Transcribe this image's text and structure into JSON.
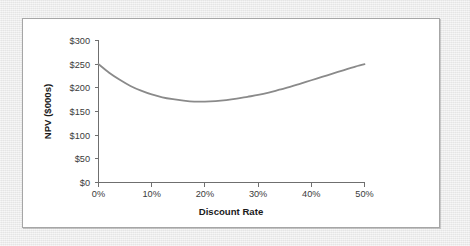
{
  "chart_data": {
    "type": "line",
    "title": "",
    "xlabel": "Discount Rate",
    "ylabel": "NPV ($000s)",
    "xlim": [
      0,
      50
    ],
    "ylim": [
      0,
      300
    ],
    "grid": false,
    "legend": false,
    "x_tick_labels": [
      "0%",
      "10%",
      "20%",
      "30%",
      "40%",
      "50%"
    ],
    "x_tick_values": [
      0,
      10,
      20,
      30,
      40,
      50
    ],
    "y_tick_labels": [
      "$0",
      "$50",
      "$100",
      "$150",
      "$200",
      "$250",
      "$300"
    ],
    "y_tick_values": [
      0,
      50,
      100,
      150,
      200,
      250,
      300
    ],
    "series": [
      {
        "name": "NPV",
        "color": "#8a8a8a",
        "x": [
          0,
          2,
          4,
          6,
          8,
          10,
          12,
          14,
          16,
          18,
          20,
          22,
          24,
          26,
          28,
          30,
          32,
          34,
          36,
          38,
          40,
          42,
          44,
          46,
          48,
          50
        ],
        "values": [
          250,
          232,
          217,
          204,
          194,
          186,
          180,
          176,
          173,
          171,
          171,
          172,
          174,
          177,
          181,
          185,
          190,
          196,
          202,
          209,
          216,
          223,
          230,
          237,
          244,
          250
        ]
      }
    ],
    "annotations": []
  },
  "panel": {
    "background_color": "#ffffff",
    "border_color": "#a6a6a6",
    "page_background_color": "#e9e9e9"
  }
}
